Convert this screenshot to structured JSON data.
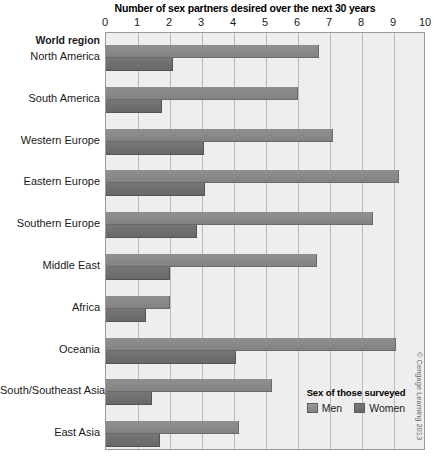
{
  "chart_data": {
    "type": "bar",
    "orientation": "horizontal",
    "title": "Number of sex partners desired over the next 30 years",
    "xlabel": "",
    "ylabel": "World region",
    "xlim": [
      0,
      10
    ],
    "xticks": [
      "0",
      "1",
      "2",
      "3",
      "4",
      "5",
      "6",
      "7",
      "8",
      "9",
      "10"
    ],
    "grid": true,
    "legend": {
      "title": "Sex of those surveyed",
      "position": "bottom-right",
      "entries": [
        "Men",
        "Women"
      ]
    },
    "categories": [
      "North America",
      "South America",
      "Western Europe",
      "Eastern Europe",
      "Southern Europe",
      "Middle East",
      "Africa",
      "Oceania",
      "South/Southeast Asia",
      "East Asia"
    ],
    "series": [
      {
        "name": "Men",
        "color": "#8a8a8a",
        "values": [
          6.65,
          6.0,
          7.1,
          9.15,
          8.35,
          6.6,
          2.0,
          9.05,
          5.2,
          4.15
        ]
      },
      {
        "name": "Women",
        "color": "#707070",
        "values": [
          2.1,
          1.75,
          3.05,
          3.1,
          2.85,
          2.0,
          1.25,
          4.05,
          1.45,
          1.7
        ]
      }
    ]
  },
  "axis_header": "World region",
  "credit": "© Cengage Learning 2013",
  "colors": {
    "plot_background": "#eeeeee",
    "gridline": "#b9b9b9",
    "border": "#9a9a9a",
    "men": "#8a8a8a",
    "women": "#707070"
  }
}
